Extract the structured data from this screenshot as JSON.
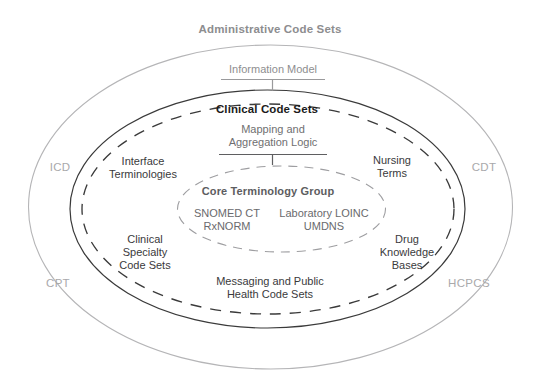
{
  "diagram": {
    "title": "Administrative Code Sets",
    "rings": [
      {
        "id": "administrative",
        "label": "Administrative Code Sets",
        "style": "solid-light",
        "color": "#b3b3b5"
      },
      {
        "id": "clinical",
        "label": "Clinical Code Sets",
        "style": "solid-dark",
        "color": "#2b2b2b"
      },
      {
        "id": "clinical-dashed",
        "label": "",
        "style": "dashed-dark",
        "color": "#2b2b2b"
      },
      {
        "id": "core",
        "label": "Core Terminology Group",
        "style": "dashed-light",
        "color": "#9a9a9d"
      }
    ],
    "callouts": [
      {
        "id": "information-model",
        "label": "Information Model",
        "target_ring": "clinical",
        "color": "#8e8e90"
      },
      {
        "id": "mapping-aggregation-logic",
        "label_line1": "Mapping and",
        "label_line2": "Aggregation Logic",
        "target_ring": "clinical-dashed",
        "color": "#5b5b5d"
      }
    ],
    "ring_labels": {
      "clinical_code_sets": "Clinical Code Sets",
      "core_terminology_group": "Core Terminology Group"
    },
    "outer_codes": [
      {
        "id": "icd",
        "label": "ICD"
      },
      {
        "id": "cdt",
        "label": "CDT"
      },
      {
        "id": "cpt",
        "label": "CPT"
      },
      {
        "id": "hcpcs",
        "label": "HCPCS"
      }
    ],
    "inner_groups": [
      {
        "id": "interface-terminologies",
        "line1": "Interface",
        "line2": "Terminologies",
        "line3": ""
      },
      {
        "id": "nursing-terms",
        "line1": "Nursing",
        "line2": "Terms",
        "line3": ""
      },
      {
        "id": "clinical-specialty-code-sets",
        "line1": "Clinical",
        "line2": "Specialty",
        "line3": "Code Sets"
      },
      {
        "id": "drug-knowledge-bases",
        "line1": "Drug",
        "line2": "Knowledge",
        "line3": "Bases"
      },
      {
        "id": "messaging-public-health",
        "line1": "Messaging and Public",
        "line2": "Health Code Sets",
        "line3": ""
      }
    ],
    "core_terms": {
      "title": "Core Terminology Group",
      "left_col": {
        "line1": "SNOMED CT",
        "line2": "RxNORM"
      },
      "right_col": {
        "line1": "Laboratory LOINC",
        "line2": "UMDNS"
      }
    }
  }
}
